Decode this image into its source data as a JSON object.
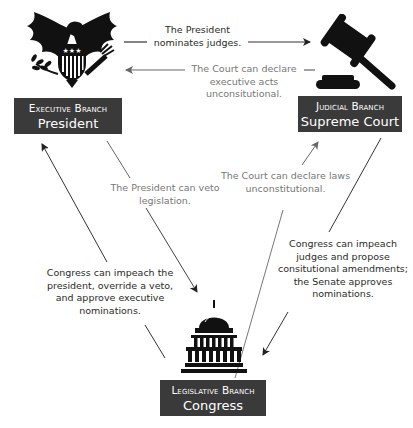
{
  "branches": {
    "executive": {
      "title": "Executive Branch",
      "subtitle": "President",
      "icon": "eagle-seal-icon"
    },
    "judicial": {
      "title": "Judicial Branch",
      "subtitle": "Supreme Court",
      "icon": "gavel-icon"
    },
    "legislative": {
      "title": "Legislative Branch",
      "subtitle": "Congress",
      "icon": "capitol-building-icon"
    }
  },
  "relationships": [
    {
      "id": "president-nominates",
      "from": "executive",
      "to": "judicial",
      "style": "dark",
      "lines": [
        "The President",
        "nominates judges."
      ]
    },
    {
      "id": "court-declares-exec",
      "from": "judicial",
      "to": "executive",
      "style": "gray",
      "lines": [
        "The Court can declare",
        "executive acts",
        "unconsitutional."
      ]
    },
    {
      "id": "president-veto",
      "from": "executive",
      "to": "legislative",
      "style": "gray",
      "lines": [
        "The President can veto",
        "legislation."
      ]
    },
    {
      "id": "congress-checks-exec",
      "from": "legislative",
      "to": "executive",
      "style": "dark",
      "lines": [
        "Congress can impeach the",
        "president, override a veto,",
        "and approve executive",
        "nominations."
      ]
    },
    {
      "id": "court-declares-laws",
      "from": "legislative",
      "to": "judicial",
      "style": "gray",
      "lines": [
        "The Court can declare laws",
        "unconstitutional."
      ]
    },
    {
      "id": "congress-checks-court",
      "from": "judicial",
      "to": "legislative",
      "style": "dark",
      "lines": [
        "Congress can impeach",
        "judges and propose",
        "consitutional amendments;",
        "the Senate approves",
        "nominations."
      ]
    }
  ],
  "colors": {
    "box": "#3a3a3a",
    "dark_text": "#2a2a2a",
    "gray_text": "#777777",
    "dark_line": "#333333",
    "gray_line": "#777777"
  }
}
